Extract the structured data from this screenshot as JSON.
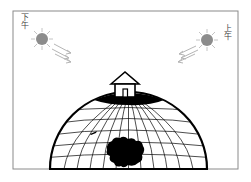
{
  "diagram": {
    "labels": {
      "afternoon": "下午",
      "morning": "上午"
    },
    "colors": {
      "frame": "#8a8a8a",
      "sun": "#8c8c8c",
      "sun_rays": "#bdbdbd",
      "light_arrows": "#b5b5b5",
      "globe_outline": "#000000",
      "grid": "#000000",
      "landmass": "#000000",
      "background": "#ffffff"
    },
    "icons": {
      "left_sun": "sun-icon",
      "right_sun": "sun-icon",
      "house": "house-icon",
      "globe": "globe-icon"
    }
  }
}
